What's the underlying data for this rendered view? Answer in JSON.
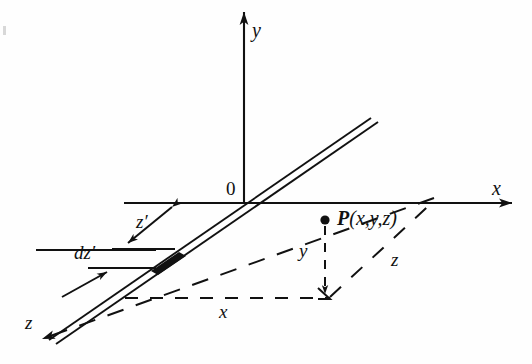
{
  "figure": {
    "title_text": "",
    "background_color": "#fefefe",
    "ink_color": "#111111",
    "labels": {
      "y_axis": "y",
      "x_axis": "x",
      "z_axis": "z",
      "origin": "0",
      "point": "P(x,y,z)",
      "point_bold_part": "P",
      "point_rest": "(x,y,z)",
      "y_component": "y",
      "x_component": "x",
      "z_component": "z",
      "z_prime": "z′",
      "dz_prime": "dz′"
    },
    "icons": {
      "point_marker": "filled-dot-icon",
      "axis_arrow": "arrowhead-icon",
      "double_arrow": "double-arrowhead-icon"
    },
    "geometry": {
      "origin": [
        244,
        203
      ],
      "y_axis_tip": [
        244,
        10
      ],
      "x_axis_tip": [
        516,
        203
      ],
      "z_axis_tip": [
        33,
        345
      ],
      "point_P": [
        325,
        221
      ],
      "wire_upper_end": [
        370,
        121
      ],
      "wire_lower_end": [
        52,
        336
      ],
      "dz_segment_start": [
        152,
        268
      ],
      "dz_segment_end": [
        181,
        248
      ]
    }
  }
}
